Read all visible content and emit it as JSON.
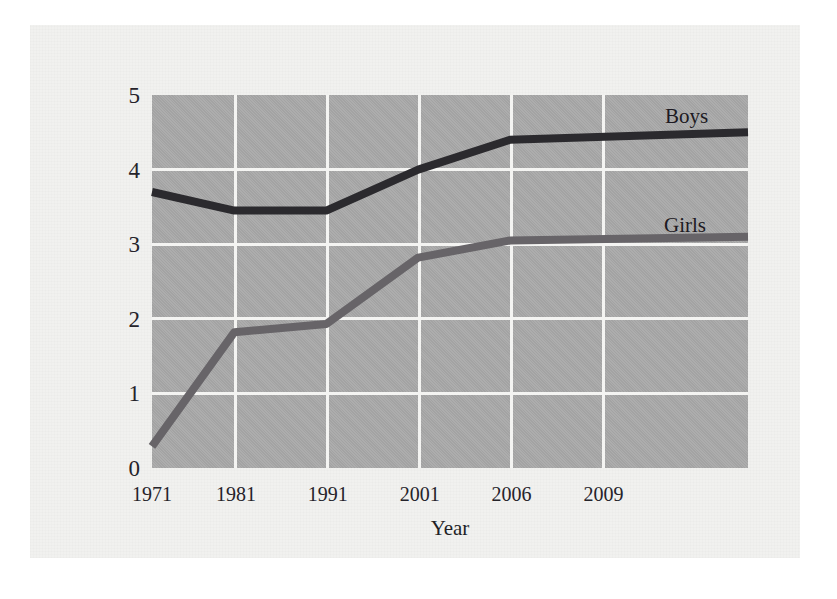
{
  "chart_data": {
    "type": "line",
    "title": "",
    "xlabel": "Year",
    "ylabel": "Number of high school students participating in athletics (millions)",
    "ylabel_line1": "Number of high school students",
    "ylabel_line2": "participating in athletics (millions)",
    "categories": [
      "1971",
      "1981",
      "1991",
      "2001",
      "2006",
      "2009"
    ],
    "x": [
      1971,
      1981,
      1991,
      2001,
      2006,
      2009
    ],
    "xtick_labels": [
      "1971",
      "1981",
      "1991",
      "2001",
      "2006",
      "2009"
    ],
    "ytick_labels": [
      "0",
      "1",
      "2",
      "3",
      "4",
      "5"
    ],
    "yticks": [
      0,
      1,
      2,
      3,
      4,
      5
    ],
    "ylim": [
      0,
      5
    ],
    "grid": true,
    "grid_color": "#f4f4f2",
    "plot_background": "#a9a9a9",
    "legend_position": "inline-right-above-line",
    "series": [
      {
        "name": "Boys",
        "color": "#2b2a2e",
        "values": [
          3.7,
          3.45,
          3.45,
          4.0,
          4.4,
          4.5
        ],
        "annotation": "Boys"
      },
      {
        "name": "Girls",
        "color": "#676468",
        "values": [
          0.29,
          1.82,
          1.93,
          2.82,
          3.05,
          3.1
        ],
        "annotation": "Girls"
      }
    ],
    "annotations": [
      {
        "text": "Boys",
        "x_px": 665,
        "y_px": 104
      },
      {
        "text": "Girls",
        "x_px": 664,
        "y_px": 213
      }
    ]
  }
}
